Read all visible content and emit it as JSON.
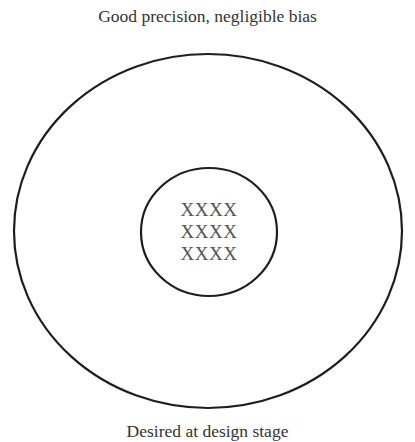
{
  "title": "Good precision, negligible bias",
  "footer": "Desired at design stage",
  "target": {
    "outer_ring": {
      "cx": 208,
      "cy": 231,
      "rx": 194,
      "ry": 177
    },
    "inner_ring": {
      "cx": 209,
      "cy": 232,
      "rx": 68,
      "ry": 64
    },
    "stroke_color": "#1e1e1e"
  },
  "hits": {
    "rows": [
      "XXXX",
      "XXXX",
      "XXXX"
    ]
  }
}
